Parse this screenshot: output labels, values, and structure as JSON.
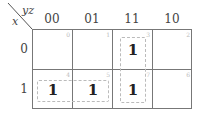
{
  "kmap": {
    "row_var": "x",
    "col_var": "yz",
    "col_labels": [
      "00",
      "01",
      "11",
      "10"
    ],
    "row_labels": [
      "0",
      "1"
    ],
    "cells": [
      [
        {
          "index": "0",
          "value": ""
        },
        {
          "index": "1",
          "value": ""
        },
        {
          "index": "3",
          "value": "1"
        },
        {
          "index": "2",
          "value": ""
        }
      ],
      [
        {
          "index": "4",
          "value": "1"
        },
        {
          "index": "5",
          "value": "1"
        },
        {
          "index": "7",
          "value": "1"
        },
        {
          "index": "6",
          "value": ""
        }
      ]
    ],
    "groups": [
      {
        "name": "group-x-ybar",
        "cells": [
          "4",
          "5"
        ]
      },
      {
        "name": "group-yz",
        "cells": [
          "3",
          "7"
        ]
      }
    ],
    "colors": {
      "grid": "#777777",
      "group_border": "#bbbbbb",
      "index_text": "#bbbbbb"
    }
  }
}
